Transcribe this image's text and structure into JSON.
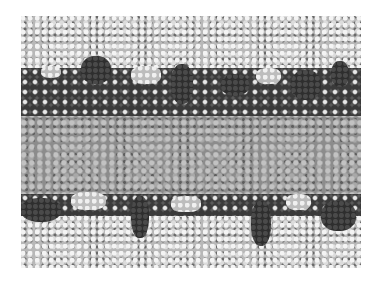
{
  "image": {
    "description": "Molecular dynamics snapshot of a lipid bilayer in water, space-filling representation",
    "regions": [
      {
        "name": "upper-water-layer",
        "shade": "light"
      },
      {
        "name": "upper-headgroup-layer",
        "shade": "dark"
      },
      {
        "name": "hydrocarbon-tail-core",
        "shade": "medium-gray"
      },
      {
        "name": "lower-headgroup-layer",
        "shade": "dark"
      },
      {
        "name": "lower-water-layer",
        "shade": "light"
      }
    ],
    "colors": {
      "background": "#ffffff",
      "water": "#b8b8b8",
      "headgroups": "#2e2e2e",
      "tails": "#8c8c8c"
    }
  }
}
